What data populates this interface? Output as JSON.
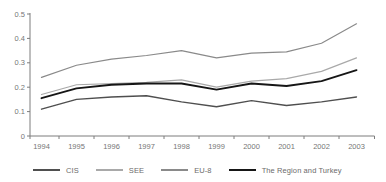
{
  "chart_data": {
    "type": "line",
    "title": "",
    "categories": [
      "1994",
      "1995",
      "1996",
      "1997",
      "1998",
      "1999",
      "2000",
      "2001",
      "2002",
      "2003"
    ],
    "series": [
      {
        "name": "CIS",
        "color": "#4f4f4f",
        "stroke_width": 1.4,
        "values": [
          0.11,
          0.15,
          0.16,
          0.165,
          0.14,
          0.12,
          0.145,
          0.125,
          0.14,
          0.16
        ]
      },
      {
        "name": "SEE",
        "color": "#a9a9a9",
        "stroke_width": 1.2,
        "values": [
          0.17,
          0.21,
          0.215,
          0.22,
          0.23,
          0.2,
          0.225,
          0.235,
          0.265,
          0.32
        ]
      },
      {
        "name": "EU-8",
        "color": "#8a8a8a",
        "stroke_width": 1.2,
        "values": [
          0.24,
          0.29,
          0.315,
          0.33,
          0.35,
          0.32,
          0.34,
          0.345,
          0.38,
          0.46
        ]
      },
      {
        "name": "The Region and Turkey",
        "color": "#161616",
        "stroke_width": 1.9,
        "values": [
          0.155,
          0.195,
          0.21,
          0.215,
          0.215,
          0.19,
          0.215,
          0.205,
          0.225,
          0.27
        ]
      }
    ],
    "xlabel": "",
    "ylabel": "",
    "ylim": [
      0,
      0.5
    ],
    "ytick_values": [
      0,
      0.1,
      0.2,
      0.3,
      0.4,
      0.5
    ],
    "ytick_labels": [
      "0",
      "0.1",
      "0.2",
      "0.3",
      "0.4",
      "0.5"
    ],
    "grid": false,
    "legend_position": "bottom",
    "axis_color": "#7d7d7d",
    "tick_label_color": "#767676"
  }
}
